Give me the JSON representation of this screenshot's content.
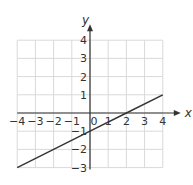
{
  "chart_data": {
    "type": "line",
    "title": "",
    "xlabel": "x",
    "ylabel": "y",
    "xlim": [
      -4,
      4
    ],
    "ylim": [
      -3,
      4
    ],
    "grid": true,
    "x_ticks": [
      "-4",
      "-3",
      "-2",
      "-1",
      "0",
      "1",
      "2",
      "3",
      "4"
    ],
    "y_ticks": [
      "4",
      "3",
      "2",
      "1",
      "-1",
      "-2",
      "-3"
    ],
    "series": [
      {
        "name": "line",
        "x": [
          -4,
          0,
          2,
          4
        ],
        "y": [
          -3,
          -1,
          0,
          1
        ],
        "slope": 0.5,
        "intercept": -1
      }
    ],
    "colors": {
      "grid": "#d9d9d9",
      "axis": "#333333",
      "line": "#333333"
    }
  }
}
